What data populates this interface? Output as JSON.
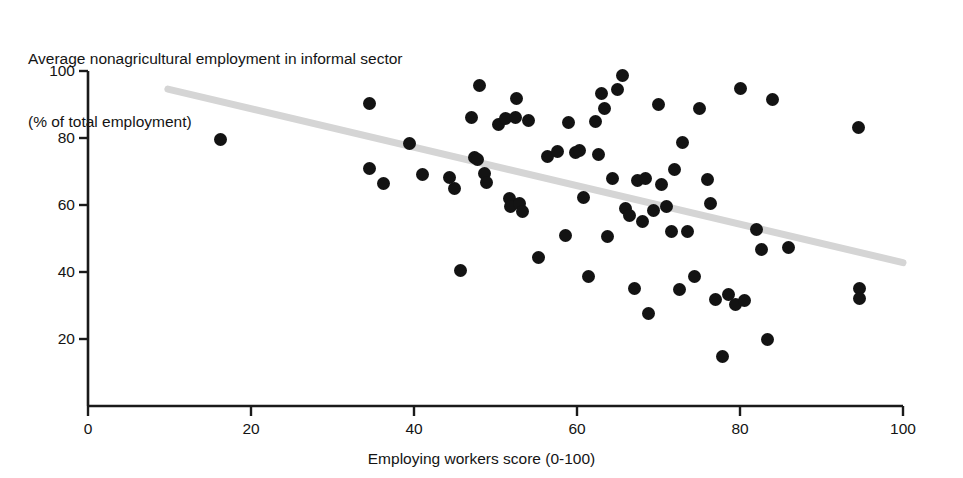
{
  "figure": {
    "title_lines": [
      "Average nonagricultural employment in informal sector",
      "(% of total employment)"
    ],
    "xlabel": "Employing workers score (0-100)",
    "marker_color": "#131313",
    "trendline_color": "#d5d5d5",
    "axis_color": "#1a1a1a"
  },
  "chart_data": {
    "type": "scatter",
    "title": "Average nonagricultural employment in informal sector (% of total employment)",
    "xlabel": "Employing workers score (0-100)",
    "ylabel": "Average nonagricultural employment in informal sector (% of total employment)",
    "xlim": [
      0,
      100
    ],
    "ylim": [
      0,
      100
    ],
    "xticks": [
      0,
      20,
      40,
      60,
      80,
      100
    ],
    "yticks": [
      20,
      40,
      60,
      80,
      100
    ],
    "grid": false,
    "legend": "none",
    "series": [
      {
        "name": "Countries",
        "marker": "filled-circle",
        "color": "#131313",
        "points": [
          [
            16.3,
            79.6
          ],
          [
            34.6,
            90.2
          ],
          [
            34.6,
            71.0
          ],
          [
            36.3,
            66.3
          ],
          [
            39.4,
            78.4
          ],
          [
            41.0,
            69.2
          ],
          [
            44.3,
            68.2
          ],
          [
            45.0,
            65.0
          ],
          [
            45.7,
            40.5
          ],
          [
            47.0,
            86.1
          ],
          [
            47.4,
            74.2
          ],
          [
            47.8,
            73.5
          ],
          [
            48.0,
            95.8
          ],
          [
            48.6,
            69.5
          ],
          [
            48.9,
            66.8
          ],
          [
            50.4,
            84.0
          ],
          [
            51.2,
            85.9
          ],
          [
            51.7,
            62.0
          ],
          [
            51.9,
            59.5
          ],
          [
            52.4,
            86.2
          ],
          [
            52.6,
            91.7
          ],
          [
            53.0,
            60.3
          ],
          [
            53.3,
            58.0
          ],
          [
            54.0,
            85.1
          ],
          [
            55.3,
            44.2
          ],
          [
            56.4,
            74.6
          ],
          [
            57.6,
            76.0
          ],
          [
            58.6,
            51.0
          ],
          [
            59.0,
            84.5
          ],
          [
            59.8,
            75.6
          ],
          [
            60.3,
            76.2
          ],
          [
            60.8,
            62.3
          ],
          [
            61.4,
            38.8
          ],
          [
            62.3,
            84.8
          ],
          [
            62.6,
            75.0
          ],
          [
            63.0,
            93.3
          ],
          [
            63.4,
            88.8
          ],
          [
            63.8,
            50.6
          ],
          [
            64.4,
            67.8
          ],
          [
            65.0,
            94.4
          ],
          [
            65.6,
            98.8
          ],
          [
            66.0,
            59.0
          ],
          [
            66.4,
            57.0
          ],
          [
            67.0,
            35.2
          ],
          [
            67.4,
            67.2
          ],
          [
            68.0,
            55.0
          ],
          [
            68.4,
            68.0
          ],
          [
            68.8,
            27.5
          ],
          [
            69.4,
            58.5
          ],
          [
            70.0,
            89.9
          ],
          [
            70.4,
            66.0
          ],
          [
            71.0,
            59.5
          ],
          [
            71.6,
            52.0
          ],
          [
            72.0,
            70.6
          ],
          [
            72.6,
            34.8
          ],
          [
            73.0,
            78.8
          ],
          [
            73.6,
            52.0
          ],
          [
            74.4,
            38.8
          ],
          [
            75.0,
            88.7
          ],
          [
            76.0,
            67.5
          ],
          [
            76.4,
            60.4
          ],
          [
            77.0,
            31.9
          ],
          [
            77.8,
            14.8
          ],
          [
            78.6,
            33.2
          ],
          [
            79.4,
            30.2
          ],
          [
            80.0,
            94.9
          ],
          [
            80.6,
            31.4
          ],
          [
            82.0,
            52.8
          ],
          [
            82.6,
            46.8
          ],
          [
            83.4,
            19.9
          ],
          [
            84.0,
            91.5
          ],
          [
            86.0,
            47.3
          ],
          [
            94.6,
            83.0
          ],
          [
            94.7,
            35.0
          ],
          [
            94.7,
            32.0
          ]
        ]
      }
    ],
    "trendline": {
      "type": "linear",
      "color": "#d5d5d5",
      "x_start": 9.8,
      "y_start": 94.6,
      "x_end": 100.0,
      "y_end": 42.8
    }
  }
}
